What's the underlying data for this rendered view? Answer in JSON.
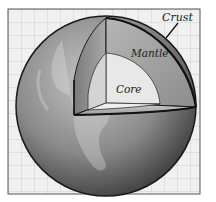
{
  "diagram": {
    "labels": {
      "crust": "Crust",
      "mantle": "Mantle",
      "core": "Core"
    },
    "colors": {
      "background_grid": "#d9d9d9",
      "grid_fill": "#f0f0f0",
      "frame": "#555555",
      "outline": "#1a1a1a",
      "core_fill": "#e6e6e6",
      "mantle_fill": "#a8a8a8",
      "sphere_light": "#bdbdbd",
      "sphere_dark": "#3a3a3a"
    }
  }
}
